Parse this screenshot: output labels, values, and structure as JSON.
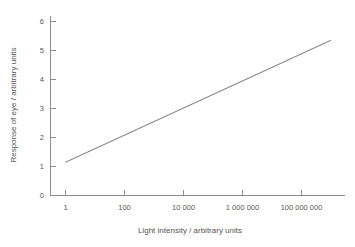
{
  "chart_data": {
    "type": "line",
    "title": "",
    "xlabel": "Light intensity / arbitrary units",
    "ylabel": "Response of eye / arbitrary units",
    "xscale": "log",
    "yscale": "linear",
    "grid": false,
    "legend": false,
    "xticklabels": [
      "1",
      "100",
      "10 000",
      "1 000 000",
      "100 000 000"
    ],
    "xtickvalues": [
      1,
      100,
      10000,
      1000000,
      100000000
    ],
    "yticklabels": [
      "0",
      "1",
      "2",
      "3",
      "4",
      "5",
      "6"
    ],
    "ytickvalues": [
      0,
      1,
      2,
      3,
      4,
      5,
      6
    ],
    "ylim": [
      0,
      6.35
    ],
    "xlim_decades": [
      -0.25,
      9.75
    ],
    "series": [
      {
        "name": "Response of eye",
        "color": "#8a8a8a",
        "x": [
          1,
          100,
          10000,
          1000000,
          100000000,
          1000000000
        ],
        "y": [
          1.15,
          1.68,
          2.21,
          2.74,
          3.27,
          3.53
        ],
        "points_decades": [
          0,
          2,
          4,
          6,
          8,
          9
        ],
        "endpoints": {
          "start": {
            "x": 1,
            "y": 1.15
          },
          "end": {
            "x": 1000000000,
            "y": 5.35
          }
        },
        "fit": "y = 1.15 + 0.525 * log10(x) over plotted range"
      }
    ],
    "axis_color": "#8d8d8d",
    "text_color": "#555555",
    "background": "#ffffff"
  },
  "figure": {
    "width": 355,
    "height": 247
  }
}
